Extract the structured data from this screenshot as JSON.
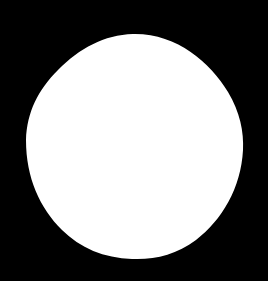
{
  "image": {
    "description": "white rounded blob on black background",
    "background_color": "#000000",
    "shape_color": "#ffffff",
    "width": 268,
    "height": 281
  }
}
